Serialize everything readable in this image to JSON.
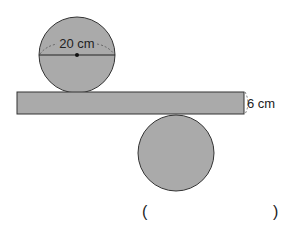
{
  "diagram": {
    "top_circle": {
      "diameter_label": "20 cm",
      "fill": "#aaaaaa"
    },
    "bar": {
      "thickness_label": "6 cm",
      "fill": "#aaaaaa"
    },
    "bottom_circle": {
      "fill": "#aaaaaa"
    }
  },
  "answer": {
    "open_paren": "(",
    "close_paren": ")"
  }
}
